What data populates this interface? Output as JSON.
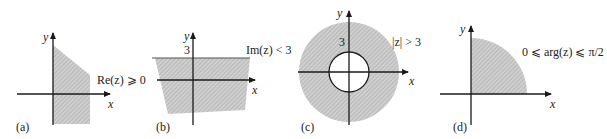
{
  "figure": {
    "colors": {
      "axis": "#1a1a1a",
      "shade": "#c8c8c8",
      "hatch": "#9a9a9a",
      "text": "#222222"
    },
    "panels": [
      {
        "id": "a",
        "tag": "(a)",
        "condition": "Re(z) ⩾ 0",
        "x_label": "x",
        "y_label": "y"
      },
      {
        "id": "b",
        "tag": "(b)",
        "condition": "Im(z) < 3",
        "x_label": "x",
        "y_label": "y",
        "tick": "3"
      },
      {
        "id": "c",
        "tag": "(c)",
        "condition": "|z| > 3",
        "x_label": "x",
        "y_label": "y",
        "tick": "3"
      },
      {
        "id": "d",
        "tag": "(d)",
        "condition": "0 ⩽ arg(z) ⩽ π/2",
        "x_label": "x",
        "y_label": "y"
      }
    ]
  }
}
